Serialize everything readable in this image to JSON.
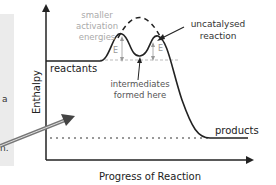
{
  "diagram": {
    "y_axis_label": "Enthalpy",
    "x_axis_label": "Progress of Reaction",
    "labels": {
      "smaller_activation": [
        "smaller",
        "activation",
        "energies"
      ],
      "uncatalysed": [
        "uncatalysed",
        "reaction"
      ],
      "reactants": "reactants",
      "intermediates": [
        "intermediates",
        "formed here"
      ],
      "products": "products",
      "ea1": "E",
      "ea2": "E"
    },
    "side_panel": {
      "fragments": [
        "a",
        "n."
      ]
    }
  }
}
